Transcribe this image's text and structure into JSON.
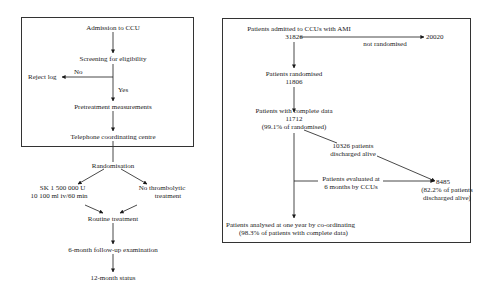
{
  "left_flowchart": {
    "nodes": {
      "admission": "Admission to CCU",
      "screening": "Screening for eligibility",
      "reject": "Reject log",
      "no": "No",
      "yes": "Yes",
      "pretreatment": "Pretreatment measurements",
      "telephone": "Telephone coordinating centre",
      "randomisation": "Randomisation",
      "sk_line1": "SK 1 500 000 U",
      "sk_line2": "10 100 ml iv/60 min",
      "nothrombo_line1": "No thrombolytic",
      "nothrombo_line2": "treatment",
      "routine": "Routine treatment",
      "followup": "6-month follow-up examination",
      "status12": "12-month status"
    }
  },
  "right_flowchart": {
    "nodes": {
      "admitted_label": "Patients admitted to CCUs with AMI",
      "admitted_count": "31826",
      "not_randomised_label": "not randomised",
      "not_randomised_count": "20020",
      "randomised_label": "Patients randomised",
      "randomised_count": "11806",
      "complete_label": "Patients with complete data",
      "complete_count": "11712",
      "complete_pct": "(99.1% of randomised)",
      "discharged_line1": "10326 patients",
      "discharged_line2": "discharged alive",
      "evaluated_line1": "Patients evaluated at",
      "evaluated_line2": "6 months by CCUs",
      "evaluated_count": "8485",
      "evaluated_pct_line1": "(82.2% of patients",
      "evaluated_pct_line2": "discharged alive)",
      "analysed_line1": "Patients analysed at one year by co-ordinating",
      "analysed_line2": "(98.3% of patients with complete data)"
    }
  }
}
